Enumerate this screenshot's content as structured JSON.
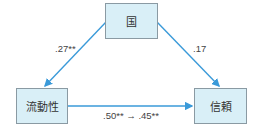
{
  "nodes": {
    "top": {
      "label": "国"
    },
    "left": {
      "label": "流動性"
    },
    "right": {
      "label": "信頼"
    }
  },
  "edges": {
    "top_to_left": {
      "label": ".27**"
    },
    "top_to_right": {
      "label": ".17"
    },
    "left_to_right": {
      "label": ".50** → .45**"
    }
  },
  "colors": {
    "node_fill": "#d9eff7",
    "node_border": "#8a9aa3",
    "arrow": "#3a9ad9"
  }
}
